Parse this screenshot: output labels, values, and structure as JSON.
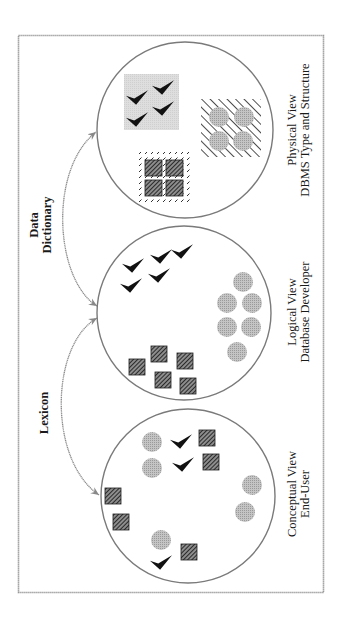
{
  "diagram": {
    "orientation": "rotated 90 degrees counter-clockwise",
    "colors": {
      "border": "#8a8a8a",
      "circle_stroke": "#7a7a7a",
      "arrow": "#8a8a8a",
      "dot_fill": "#b5b5b5",
      "hatch_dark": "#2a2a2a",
      "check_fill": "#111111",
      "gray_panel": "#d9d9d9"
    },
    "views": [
      {
        "id": "physical",
        "title": "Physical View",
        "subtitle": "DBMS Type and Structure"
      },
      {
        "id": "logical",
        "title": "Logical View",
        "subtitle": "Database Developer"
      },
      {
        "id": "conceptual",
        "title": "Conceptual View",
        "subtitle": "End-User"
      }
    ],
    "arrows": [
      {
        "label_line1": "Data",
        "label_line2": "Dictionary",
        "from": "logical",
        "to": "physical"
      },
      {
        "label_line1": "Lexicon",
        "from": "logical",
        "to": "conceptual"
      }
    ],
    "shapes": {
      "physical": {
        "checkmarks": 4,
        "hatched_squares": 4,
        "gray_circles": 4,
        "grouped": true
      },
      "logical": {
        "checkmarks": 5,
        "hatched_squares": 5,
        "gray_circles": 6,
        "grouped": false
      },
      "conceptual": {
        "checkmarks": 3,
        "hatched_squares": 5,
        "gray_circles": 6,
        "grouped": false
      }
    }
  }
}
